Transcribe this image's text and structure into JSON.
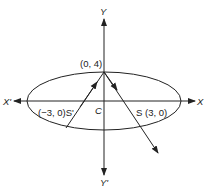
{
  "diagram": {
    "type": "ellipse-reflection",
    "colors": {
      "stroke": "#222222",
      "background": "#ffffff"
    },
    "axes": {
      "x_positive_label": "X",
      "x_negative_label": "X'",
      "y_positive_label": "Y",
      "y_negative_label": "Y'"
    },
    "center_label": "C",
    "points": {
      "top_vertex": "(0, 4)",
      "left_focus": "(−3, 0)S'",
      "right_focus": "S (3, 0)"
    }
  }
}
